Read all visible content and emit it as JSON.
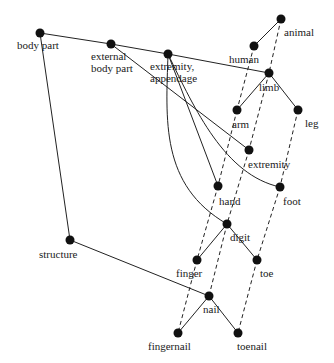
{
  "diagram": {
    "type": "semantic-network",
    "nodes": [
      {
        "id": "body_part",
        "label": "body part",
        "x": 40,
        "y": 33,
        "lx": 17,
        "ly": 40
      },
      {
        "id": "external_body_part",
        "label": "external\nbody part",
        "x": 111,
        "y": 44,
        "lx": 91,
        "ly": 51
      },
      {
        "id": "extremity_appendage",
        "label": "extremity,\nappendage",
        "x": 168,
        "y": 54,
        "lx": 150,
        "ly": 61
      },
      {
        "id": "animal",
        "label": "animal",
        "x": 281,
        "y": 19,
        "lx": 284,
        "ly": 27
      },
      {
        "id": "human",
        "label": "human",
        "x": 254,
        "y": 46,
        "lx": 229,
        "ly": 54
      },
      {
        "id": "limb",
        "label": "limb",
        "x": 269,
        "y": 73,
        "lx": 259,
        "ly": 82
      },
      {
        "id": "arm",
        "label": "arm",
        "x": 237,
        "y": 110,
        "lx": 232,
        "ly": 119
      },
      {
        "id": "leg",
        "label": "leg",
        "x": 298,
        "y": 110,
        "lx": 305,
        "ly": 118
      },
      {
        "id": "extremity",
        "label": "extremity",
        "x": 249,
        "y": 150,
        "lx": 248,
        "ly": 159
      },
      {
        "id": "hand",
        "label": "hand",
        "x": 218,
        "y": 186,
        "lx": 219,
        "ly": 196
      },
      {
        "id": "foot",
        "label": "foot",
        "x": 280,
        "y": 187,
        "lx": 283,
        "ly": 196
      },
      {
        "id": "digit",
        "label": "digit",
        "x": 227,
        "y": 224,
        "lx": 230,
        "ly": 232
      },
      {
        "id": "finger",
        "label": "finger",
        "x": 197,
        "y": 260,
        "lx": 176,
        "ly": 268
      },
      {
        "id": "toe",
        "label": "toe",
        "x": 257,
        "y": 260,
        "lx": 260,
        "ly": 268
      },
      {
        "id": "structure",
        "label": "structure",
        "x": 70,
        "y": 240,
        "lx": 39,
        "ly": 249
      },
      {
        "id": "nail",
        "label": "nail",
        "x": 209,
        "y": 296,
        "lx": 203,
        "ly": 304
      },
      {
        "id": "fingernail",
        "label": "fingernail",
        "x": 178,
        "y": 333,
        "lx": 148,
        "ly": 341
      },
      {
        "id": "toenail",
        "label": "toenail",
        "x": 238,
        "y": 333,
        "lx": 237,
        "ly": 341
      }
    ],
    "solid_edges": [
      [
        "body_part",
        "external_body_part"
      ],
      [
        "external_body_part",
        "extremity_appendage"
      ],
      [
        "extremity_appendage",
        "limb"
      ],
      [
        "body_part",
        "structure"
      ],
      [
        "structure",
        "nail"
      ],
      [
        "external_body_part",
        "extremity"
      ],
      [
        "extremity_appendage",
        "hand"
      ],
      [
        "extremity_appendage",
        "foot"
      ],
      [
        "extremity_appendage",
        "digit"
      ],
      [
        "animal",
        "human"
      ],
      [
        "limb",
        "arm"
      ],
      [
        "limb",
        "leg"
      ],
      [
        "digit",
        "finger"
      ],
      [
        "digit",
        "toe"
      ],
      [
        "nail",
        "fingernail"
      ],
      [
        "nail",
        "toenail"
      ]
    ],
    "dashed_edges": [
      [
        "human",
        "arm"
      ],
      [
        "arm",
        "hand"
      ],
      [
        "hand",
        "finger"
      ],
      [
        "finger",
        "fingernail"
      ],
      [
        "animal",
        "limb"
      ],
      [
        "limb",
        "extremity"
      ],
      [
        "extremity",
        "digit"
      ],
      [
        "digit",
        "nail"
      ],
      [
        "leg",
        "foot"
      ],
      [
        "foot",
        "toe"
      ],
      [
        "toe",
        "toenail"
      ]
    ],
    "colors": {
      "line": "#222222",
      "node": "#111111",
      "background": "#ffffff"
    }
  }
}
